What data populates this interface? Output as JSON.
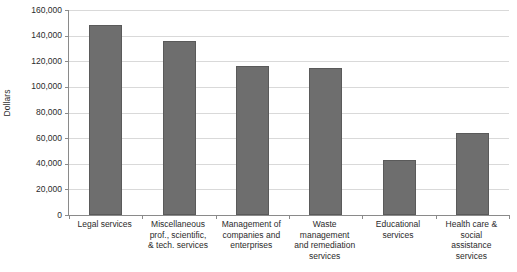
{
  "chart_data": {
    "type": "bar",
    "title": "",
    "subtitle": "",
    "xlabel": "",
    "ylabel": "Dollars",
    "ylim": [
      0,
      160000
    ],
    "ytick_step": 20000,
    "grid": true,
    "legend": false,
    "bar_color": "#6e6e6e",
    "bar_border_color": "#5a5a5a",
    "axis_color": "#8a8a8a",
    "gridline_color": "#d9d9d9",
    "categories": [
      "Legal services",
      "Miscellaneous prof., scientific, & tech. services",
      "Management of companies and enterprises",
      "Waste management and remediation services",
      "Educational services",
      "Health care & social assistance services"
    ],
    "category_lines": [
      [
        "Legal services"
      ],
      [
        "Miscellaneous",
        "prof., scientific,",
        "& tech. services"
      ],
      [
        "Management of",
        "companies and",
        "enterprises"
      ],
      [
        "Waste",
        "management",
        "and remediation",
        "services"
      ],
      [
        "Educational",
        "services"
      ],
      [
        "Health care &",
        "social",
        "assistance",
        "services"
      ]
    ],
    "values": [
      148000,
      136000,
      116000,
      115000,
      43000,
      64000
    ],
    "ytick_labels": [
      "160,000",
      "140,000",
      "120,000",
      "100,000",
      "80,000",
      "60,000",
      "40,000",
      "20,000",
      "0"
    ],
    "ytick_values": [
      160000,
      140000,
      120000,
      100000,
      80000,
      60000,
      40000,
      20000,
      0
    ]
  }
}
